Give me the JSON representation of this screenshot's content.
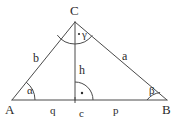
{
  "figure": {
    "kind": "triangle-with-altitude",
    "background_color": "#ffffff",
    "stroke_color": "#4a4a4a",
    "text_color": "#2b2b2b",
    "vertices": {
      "A": {
        "label": "A",
        "x": 12,
        "y": 100
      },
      "B": {
        "label": "B",
        "x": 167,
        "y": 100
      },
      "C": {
        "label": "C",
        "x": 75,
        "y": 22
      },
      "F": {
        "label": "",
        "x": 75,
        "y": 100
      }
    },
    "sides": {
      "a": {
        "label": "a",
        "x": 124,
        "y": 56
      },
      "b": {
        "label": "b",
        "x": 36,
        "y": 58
      },
      "c": {
        "label": "c",
        "x": 81,
        "y": 114
      },
      "h": {
        "label": "h",
        "x": 81,
        "y": 70
      },
      "p": {
        "label": "p",
        "x": 115,
        "y": 113
      },
      "q": {
        "label": "q",
        "x": 53,
        "y": 113
      }
    },
    "angles": {
      "alpha": {
        "label": "α",
        "x": 32,
        "y": 90,
        "vertex": "A"
      },
      "beta": {
        "label": "β",
        "x": 152,
        "y": 90,
        "vertex": "B"
      },
      "gamma": {
        "label": "γ",
        "x": 83,
        "y": 35,
        "vertex": "C"
      },
      "right_angle": {
        "label": "",
        "x": 75,
        "y": 100,
        "vertex": "F",
        "marker": "dot-arc"
      }
    },
    "vertex_label_positions": {
      "A": {
        "x": 6,
        "y": 106
      },
      "B": {
        "x": 163,
        "y": 106
      },
      "C": {
        "x": 70,
        "y": 6
      }
    }
  }
}
